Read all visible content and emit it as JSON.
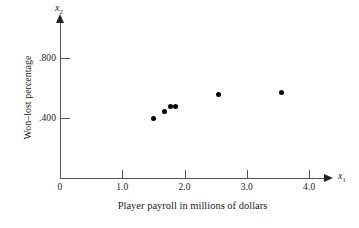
{
  "chart_data": {
    "type": "scatter",
    "title": "",
    "xlabel": "Player payroll in millions of dollars",
    "ylabel": "Won–lost percentage",
    "x_var": "x",
    "x_var_sub": "1",
    "y_var": "x",
    "y_var_sub": "2",
    "xlim": [
      0,
      4.25
    ],
    "ylim": [
      0,
      1.04
    ],
    "grid": false,
    "legend": null,
    "xticks": [
      {
        "value": 0,
        "label": "0"
      },
      {
        "value": 1.0,
        "label": "1.0"
      },
      {
        "value": 2.0,
        "label": "2.0"
      },
      {
        "value": 3.0,
        "label": "3.0"
      },
      {
        "value": 4.0,
        "label": "4.0"
      }
    ],
    "yticks": [
      {
        "value": 0.4,
        "label": ".400"
      },
      {
        "value": 0.8,
        "label": ".800"
      }
    ],
    "x": [
      1.5,
      1.67,
      1.77,
      1.85,
      2.55,
      3.55
    ],
    "y": [
      0.4,
      0.443,
      0.477,
      0.478,
      0.555,
      0.572
    ],
    "points": [
      {
        "x": 1.5,
        "y": 0.4
      },
      {
        "x": 1.67,
        "y": 0.443
      },
      {
        "x": 1.77,
        "y": 0.477
      },
      {
        "x": 1.85,
        "y": 0.478
      },
      {
        "x": 2.55,
        "y": 0.555
      },
      {
        "x": 3.55,
        "y": 0.572
      }
    ],
    "marker": "filled-circle",
    "marker_color": "#000000",
    "axis_color": "#555555"
  }
}
